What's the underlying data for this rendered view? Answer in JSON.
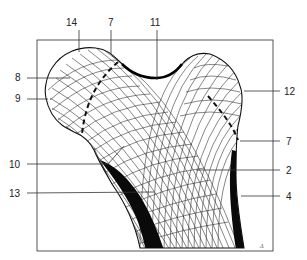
{
  "figure": {
    "signature": "Δ",
    "labels": [
      {
        "id": "14",
        "text": "14",
        "x": 66,
        "y": 26
      },
      {
        "id": "7a",
        "text": "7",
        "x": 111,
        "y": 26
      },
      {
        "id": "11",
        "text": "11",
        "x": 156,
        "y": 26
      },
      {
        "id": "8",
        "text": "8",
        "x": 15,
        "y": 81
      },
      {
        "id": "9",
        "text": "9",
        "x": 15,
        "y": 102
      },
      {
        "id": "12",
        "text": "12",
        "x": 283,
        "y": 95
      },
      {
        "id": "10",
        "text": "10",
        "x": 10,
        "y": 168
      },
      {
        "id": "7b",
        "text": "7",
        "x": 283,
        "y": 144
      },
      {
        "id": "2",
        "text": "2",
        "x": 286,
        "y": 174
      },
      {
        "id": "13",
        "text": "13",
        "x": 10,
        "y": 197
      },
      {
        "id": "4",
        "text": "4",
        "x": 286,
        "y": 200
      }
    ],
    "colors": {
      "line": "#222222",
      "cortex": "#0a0a0a",
      "background": "#ffffff",
      "frame": "#444444"
    }
  }
}
